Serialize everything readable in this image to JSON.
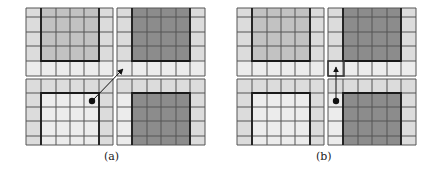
{
  "figure": {
    "panels": [
      {
        "id": "a",
        "label": "(a)",
        "offset_x": 26,
        "label_x": 104,
        "arrow": {
          "from": [
            92,
            101
          ],
          "to": [
            123,
            69
          ],
          "direction": "diagonal"
        },
        "highlight_cell": null,
        "inner_box_bottom_left": {
          "x0": 41,
          "x1": 98,
          "y0": 93
        }
      },
      {
        "id": "b",
        "label": "(b)",
        "offset_x": 237,
        "label_x": 316,
        "arrow": {
          "from": [
            336,
            101
          ],
          "to": [
            336,
            67
          ],
          "direction": "vertical"
        },
        "highlight_cell": {
          "x": 328,
          "y": 61,
          "w": 16,
          "h": 15
        },
        "inner_box_bottom_left": {
          "x0": 252,
          "x1": 311,
          "y0": 93
        }
      }
    ],
    "colors": {
      "light_cell": "#dcdcdc",
      "white_cell": "#ececec",
      "medium_cell": "#c2c2c2",
      "dark_cell": "#8c8c8c",
      "grid_line": "#555555",
      "thick_line": "#1a1a1a",
      "arrow": "#111111"
    }
  }
}
